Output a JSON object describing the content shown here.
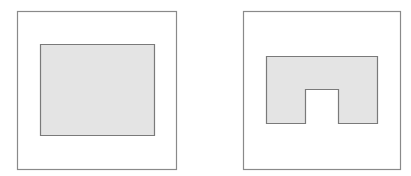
{
  "colors": {
    "background": "#ffffff",
    "frame_stroke": "#8a8a8a",
    "shape_fill": "#e4e4e4",
    "shape_stroke": "#7a7a7a"
  },
  "panels": [
    {
      "name": "left-panel",
      "frame": {
        "x": 17.5,
        "y": 11.5,
        "width": 159,
        "height": 158
      },
      "shape": {
        "type": "rectangle",
        "points": "40.5,44.5 154.5,44.5 154.5,135.5 40.5,135.5"
      }
    },
    {
      "name": "right-panel",
      "frame": {
        "x": 243.5,
        "y": 11.5,
        "width": 157,
        "height": 158
      },
      "shape": {
        "type": "notched-rectangle",
        "points": "266.5,56.5 377.5,56.5 377.5,123.5 338.5,123.5 338.5,89.5 305.5,89.5 305.5,123.5 266.5,123.5"
      }
    }
  ]
}
